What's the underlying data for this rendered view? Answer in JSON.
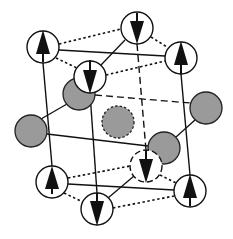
{
  "diagram": {
    "title": "",
    "colors": {
      "background": "#ffffff",
      "line": "#111111",
      "atom_fill_gray": "#9a9a9a",
      "spin_atom_fill": "#ffffff"
    },
    "spin_atoms": [
      {
        "id": "top-back-left",
        "cx": 43,
        "cy": 47,
        "r": 16,
        "spin": "up",
        "dashed": false
      },
      {
        "id": "top-front-left",
        "cx": 90,
        "cy": 77,
        "r": 16,
        "spin": "down",
        "dashed": false
      },
      {
        "id": "top-back-right",
        "cx": 137,
        "cy": 28,
        "r": 16,
        "spin": "down",
        "dashed": false
      },
      {
        "id": "top-front-right",
        "cx": 181,
        "cy": 58,
        "r": 16,
        "spin": "up",
        "dashed": false
      },
      {
        "id": "bottom-back-left",
        "cx": 52,
        "cy": 182,
        "r": 16,
        "spin": "up",
        "dashed": false
      },
      {
        "id": "bottom-front-left",
        "cx": 97,
        "cy": 209,
        "r": 16,
        "spin": "down",
        "dashed": false
      },
      {
        "id": "bottom-back-right",
        "cx": 146,
        "cy": 166,
        "r": 16,
        "spin": "down",
        "dashed": true
      },
      {
        "id": "bottom-front-right",
        "cx": 190,
        "cy": 191,
        "r": 16,
        "spin": "up",
        "dashed": false
      }
    ],
    "gray_atoms": [
      {
        "id": "gray-upper-left",
        "cx": 79,
        "cy": 94,
        "r": 16,
        "dashed": false
      },
      {
        "id": "gray-left",
        "cx": 31,
        "cy": 131,
        "r": 16,
        "dashed": false
      },
      {
        "id": "gray-center",
        "cx": 118,
        "cy": 122,
        "r": 16,
        "dashed": true
      },
      {
        "id": "gray-lower-right",
        "cx": 164,
        "cy": 148,
        "r": 16,
        "dashed": false
      },
      {
        "id": "gray-right",
        "cx": 206,
        "cy": 108,
        "r": 16,
        "dashed": false
      }
    ]
  }
}
